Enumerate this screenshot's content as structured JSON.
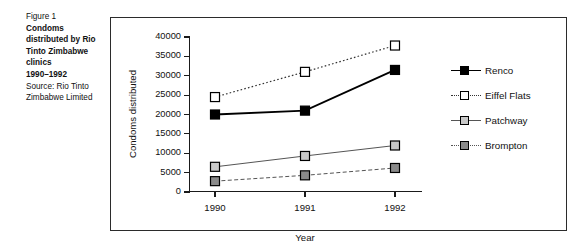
{
  "caption": {
    "figure_number": "Figure 1",
    "title": "Condoms distributed by Rio Tinto Zimbabwe clinics",
    "years": "1990–1992",
    "source": "Source: Rio Tinto Zimbabwe Limited"
  },
  "chart_data": {
    "type": "line",
    "title": "Condoms distributed by Rio Tinto Zimbabwe clinics 1990–1992",
    "xlabel": "Year",
    "ylabel": "Condoms distributed",
    "categories": [
      "1990",
      "1991",
      "1992"
    ],
    "x": [
      1990,
      1991,
      1992
    ],
    "ylim": [
      0,
      40000
    ],
    "yticks": [
      0,
      5000,
      10000,
      15000,
      20000,
      25000,
      30000,
      35000,
      40000
    ],
    "ytick_labels": [
      "0",
      "5000",
      "10000",
      "15000",
      "20000",
      "25000",
      "30000",
      "35000",
      "40000"
    ],
    "grid": false,
    "legend_position": "right",
    "series": [
      {
        "name": "Renco",
        "values": [
          20000,
          21000,
          31500
        ],
        "marker": "filled-square",
        "marker_color": "#000000",
        "line_style": "solid",
        "line_color": "#000000",
        "line_width": 1.8,
        "marker_size": 9
      },
      {
        "name": "Eiffel Flats",
        "values": [
          24500,
          31000,
          37800
        ],
        "marker": "hollow-square",
        "marker_color": "#ffffff",
        "line_style": "dotted",
        "line_color": "#333333",
        "line_width": 1.2,
        "marker_size": 9
      },
      {
        "name": "Patchway",
        "values": [
          6500,
          9300,
          12000
        ],
        "marker": "filled-square",
        "marker_color": "#c9c9c9",
        "line_style": "solid",
        "line_color": "#555555",
        "line_width": 1.0,
        "marker_size": 9
      },
      {
        "name": "Brompton",
        "values": [
          2800,
          4300,
          6200
        ],
        "marker": "filled-square",
        "marker_color": "#8a8a8a",
        "line_style": "dashed",
        "line_color": "#555555",
        "line_width": 1.0,
        "marker_size": 9
      }
    ]
  },
  "colors": {
    "frame": "#2b2b2b",
    "axis": "#1a1a1a",
    "text": "#111111",
    "background": "#ffffff"
  }
}
